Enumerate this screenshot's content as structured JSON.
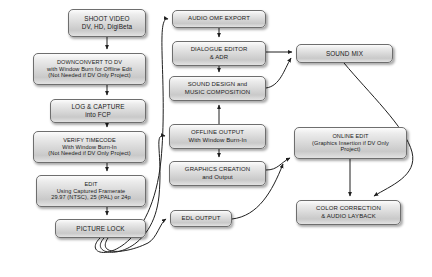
{
  "diagram": {
    "type": "flowchart",
    "background_color": "#ffffff",
    "node_fill_color": "#d8d8d8",
    "node_border_color": "#6e6e6e",
    "edge_color": "#2b2b2b",
    "columns": [
      {
        "name": "capture-edit-column",
        "label": "Capture and Offline Edit"
      },
      {
        "name": "audio-graphics-column",
        "label": "Audio, Graphics and Output"
      },
      {
        "name": "finishing-column",
        "label": "Mix and Finishing"
      }
    ],
    "nodes": [
      {
        "id": "shoot-video",
        "name": "shoot-video",
        "column": "capture-edit-column",
        "text": "SHOOT VIDEO\nDV, HD, DigiBeta",
        "lines": [
          "SHOOT VIDEO",
          "DV, HD, DigiBeta"
        ],
        "x": 68,
        "y": 9,
        "w": 78,
        "h": 28
      },
      {
        "id": "downconvert-to-dv",
        "name": "downconvert-to-dv",
        "column": "capture-edit-column",
        "text": "DOWNCONVERT TO DV\nwith Window Burn for Offline Edit\n(Not Needed if DV Only Project)",
        "lines": [
          "DOWNCONVERT TO DV",
          "with Window Burn for Offline Edit",
          "(Not Needed if DV Only Project)"
        ],
        "x": 33,
        "y": 53,
        "w": 113,
        "h": 32
      },
      {
        "id": "log-and-capture",
        "name": "log-and-capture",
        "column": "capture-edit-column",
        "text": "LOG & CAPTURE\ninto FCP",
        "lines": [
          "LOG & CAPTURE",
          "into FCP"
        ],
        "x": 50,
        "y": 99,
        "w": 96,
        "h": 24
      },
      {
        "id": "verify-timecode",
        "name": "verify-timecode",
        "column": "capture-edit-column",
        "text": "VERIFY TIMECODE\nWith Window Burn-In\n(Not Needed if DV Only Project)",
        "lines": [
          "VERIFY TIMECODE",
          "With Window Burn-In",
          "(Not Needed if DV Only Project)"
        ],
        "x": 33,
        "y": 131,
        "w": 113,
        "h": 32
      },
      {
        "id": "edit",
        "name": "edit",
        "column": "capture-edit-column",
        "text": "EDIT\nUsing Captured Framerate\n29.97 (NTSC), 25 (PAL) or 24p",
        "lines": [
          "EDIT",
          "Using Captured Framerate",
          "29.97 (NTSC), 25 (PAL)  or 24p"
        ],
        "x": 36,
        "y": 175,
        "w": 110,
        "h": 32
      },
      {
        "id": "picture-lock",
        "name": "picture-lock",
        "column": "capture-edit-column",
        "text": "PICTURE LOCK",
        "lines": [
          "PICTURE LOCK"
        ],
        "x": 55,
        "y": 219,
        "w": 91,
        "h": 19
      },
      {
        "id": "audio-omf-export",
        "name": "audio-omf-export",
        "column": "audio-graphics-column",
        "text": "AUDIO OMF EXPORT",
        "lines": [
          "AUDIO OMF EXPORT"
        ],
        "x": 172,
        "y": 10,
        "w": 94,
        "h": 18
      },
      {
        "id": "dialogue-editor-adr",
        "name": "dialogue-editor-and-adr",
        "column": "audio-graphics-column",
        "text": "DIALOGUE EDITOR\n& ADR",
        "lines": [
          "DIALOGUE EDITOR",
          "& ADR"
        ],
        "x": 172,
        "y": 41,
        "w": 94,
        "h": 25
      },
      {
        "id": "sound-design-music",
        "name": "sound-design-and-music-composition",
        "column": "audio-graphics-column",
        "text": "SOUND DESIGN and\nMUSIC COMPOSITION",
        "lines": [
          "SOUND DESIGN and",
          "MUSIC COMPOSITION"
        ],
        "x": 169,
        "y": 76,
        "w": 97,
        "h": 25
      },
      {
        "id": "offline-output",
        "name": "offline-output",
        "column": "audio-graphics-column",
        "text": "OFFLINE OUTPUT\nWith Window Burn-In",
        "lines": [
          "OFFLINE OUTPUT",
          "With Window Burn-In"
        ],
        "x": 169,
        "y": 124,
        "w": 97,
        "h": 25
      },
      {
        "id": "graphics-creation",
        "name": "graphics-creation-and-output",
        "column": "audio-graphics-column",
        "text": "GRAPHICS CREATION\nand Output",
        "lines": [
          "GRAPHICS CREATION",
          "and Output"
        ],
        "x": 169,
        "y": 161,
        "w": 97,
        "h": 25
      },
      {
        "id": "edl-output",
        "name": "edl-output",
        "column": "audio-graphics-column",
        "text": "EDL OUTPUT",
        "lines": [
          "EDL OUTPUT"
        ],
        "x": 170,
        "y": 210,
        "w": 62,
        "h": 17
      },
      {
        "id": "sound-mix",
        "name": "sound-mix",
        "column": "finishing-column",
        "text": "SOUND MIX",
        "lines": [
          "SOUND MIX"
        ],
        "x": 296,
        "y": 44,
        "w": 97,
        "h": 19
      },
      {
        "id": "online-edit",
        "name": "online-edit",
        "column": "finishing-column",
        "text": "ONLINE EDIT\n(Graphics Insertion if DV Only\nProject)",
        "lines": [
          "ONLINE EDIT",
          "(Graphics Insertion if DV Only",
          "Project)"
        ],
        "x": 294,
        "y": 127,
        "w": 113,
        "h": 32
      },
      {
        "id": "color-correction",
        "name": "color-correction-and-audio-layback",
        "column": "finishing-column",
        "text": "COLOR CORRECTION\n& AUDIO LAYBACK",
        "lines": [
          "COLOR CORRECTION",
          "& AUDIO LAYBACK"
        ],
        "x": 296,
        "y": 200,
        "w": 105,
        "h": 25
      }
    ],
    "edges": [
      {
        "name": "edge-shoot-to-downconvert",
        "from": "shoot-video",
        "to": "downconvert-to-dv",
        "style": "straight-arrow"
      },
      {
        "name": "edge-downconvert-to-log",
        "from": "downconvert-to-dv",
        "to": "log-and-capture",
        "style": "straight-arrow"
      },
      {
        "name": "edge-log-to-verify",
        "from": "log-and-capture",
        "to": "verify-timecode",
        "style": "straight-arrow"
      },
      {
        "name": "edge-verify-to-edit",
        "from": "verify-timecode",
        "to": "edit",
        "style": "straight-arrow"
      },
      {
        "name": "edge-edit-to-picture-lock",
        "from": "edit",
        "to": "picture-lock",
        "style": "straight-arrow"
      },
      {
        "name": "edge-picture-lock-to-audio-omf",
        "from": "picture-lock",
        "to": "audio-omf-export",
        "style": "curved-arrow"
      },
      {
        "name": "edge-picture-lock-to-offline-output",
        "from": "picture-lock",
        "to": "offline-output",
        "style": "curved-arrow"
      },
      {
        "name": "edge-picture-lock-to-edl-output",
        "from": "picture-lock",
        "to": "edl-output",
        "style": "curved-arrow"
      },
      {
        "name": "edge-audio-omf-to-dialogue-editor",
        "from": "audio-omf-export",
        "to": "dialogue-editor-adr",
        "style": "straight-arrow"
      },
      {
        "name": "edge-dialogue-editor-to-sound-design",
        "from": "dialogue-editor-adr",
        "to": "sound-design-music",
        "style": "straight-arrow"
      },
      {
        "name": "edge-offline-output-to-sound-design",
        "from": "offline-output",
        "to": "sound-design-music",
        "style": "straight-arrow"
      },
      {
        "name": "edge-dialogue-editor-to-sound-mix",
        "from": "dialogue-editor-adr",
        "to": "sound-mix",
        "style": "straight-arrow"
      },
      {
        "name": "edge-sound-design-to-sound-mix",
        "from": "sound-design-music",
        "to": "sound-mix",
        "style": "curved-arrow"
      },
      {
        "name": "edge-offline-output-to-graphics-creation",
        "from": "offline-output",
        "to": "graphics-creation",
        "style": "straight-arrow"
      },
      {
        "name": "edge-graphics-creation-to-online-edit",
        "from": "graphics-creation",
        "to": "online-edit",
        "style": "curved-arrow"
      },
      {
        "name": "edge-edl-output-to-online-edit",
        "from": "edl-output",
        "to": "online-edit",
        "style": "curved-arrow"
      },
      {
        "name": "edge-online-edit-to-color-correction",
        "from": "online-edit",
        "to": "color-correction",
        "style": "straight-arrow"
      },
      {
        "name": "edge-sound-mix-to-color-correction",
        "from": "sound-mix",
        "to": "color-correction",
        "style": "curved-arrow"
      }
    ]
  }
}
